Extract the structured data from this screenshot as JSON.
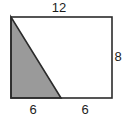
{
  "figure": {
    "type": "geometry-diagram",
    "background_color": "#ffffff",
    "stroke_color": "#2b2b2b",
    "shaded_fill_color": "#9a9a9a",
    "label_color": "#1c1c1c",
    "rectangle": {
      "name": "outer-rectangle",
      "top_left": [
        11,
        17
      ],
      "top_right": [
        112,
        17
      ],
      "bottom_right": [
        112,
        98
      ],
      "bottom_left": [
        11,
        98
      ],
      "width_units": 12,
      "height_units": 8
    },
    "shaded_triangle": {
      "name": "shaded-triangle",
      "vertices": [
        [
          11,
          17
        ],
        [
          11,
          98
        ],
        [
          61,
          98
        ]
      ],
      "base_units": 6,
      "height_units": 8,
      "fill": "#9a9a9a"
    },
    "labels": {
      "top": "12",
      "right": "8",
      "bottom_left": "6",
      "bottom_right": "6"
    }
  },
  "chart_data": {
    "type": "diagram",
    "title": "",
    "shapes": [
      {
        "shape": "rectangle",
        "label": "outer rectangle",
        "width": 12,
        "height": 8,
        "filled": false
      },
      {
        "shape": "right-triangle",
        "label": "shaded triangle",
        "base": 6,
        "height": 8,
        "filled": true,
        "fill_color": "#9a9a9a"
      }
    ],
    "annotations": [
      {
        "text": "12",
        "position": "top",
        "refers_to": "rectangle width"
      },
      {
        "text": "8",
        "position": "right",
        "refers_to": "rectangle height"
      },
      {
        "text": "6",
        "position": "bottom-left",
        "refers_to": "triangle base"
      },
      {
        "text": "6",
        "position": "bottom-right",
        "refers_to": "remaining bottom segment"
      }
    ]
  }
}
